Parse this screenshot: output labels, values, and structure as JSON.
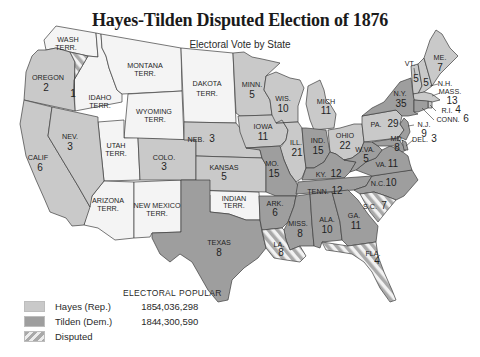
{
  "header": {
    "title": "Hayes-Tilden Disputed Election of 1876",
    "subtitle": "Electoral Vote by State"
  },
  "colors": {
    "hayes": "#c9c9c9",
    "tilden": "#9e9e9e",
    "territory": "#f4f4f4",
    "disputed_stripe": "#a9a9a9",
    "border": "#3a3a3a"
  },
  "legend": {
    "col_electoral": "ELECTORAL",
    "col_popular": "POPULAR",
    "rows": [
      {
        "name": "Hayes (Rep.)",
        "electoral": "185",
        "popular": "4,036,298",
        "swatch": "hayes"
      },
      {
        "name": "Tilden (Dem.)",
        "electoral": "184",
        "popular": "4,300,590",
        "swatch": "tilden"
      },
      {
        "name": "Disputed",
        "electoral": "",
        "popular": "",
        "swatch": "disputed"
      }
    ]
  },
  "map": {
    "regions": [
      {
        "id": "wash",
        "label": "WASH",
        "label2": "TERR.",
        "votes": "",
        "party": "territory"
      },
      {
        "id": "oregon",
        "label": "OREGON",
        "votes": "2",
        "party": "hayes"
      },
      {
        "id": "oregon-disputed",
        "label": "",
        "votes": "1",
        "party": "disputed"
      },
      {
        "id": "idaho",
        "label": "IDAHO",
        "label2": "TERR.",
        "votes": "",
        "party": "territory"
      },
      {
        "id": "montana",
        "label": "MONTANA",
        "label2": "TERR.",
        "votes": "",
        "party": "territory"
      },
      {
        "id": "wyoming",
        "label": "WYOMING",
        "label2": "TERR.",
        "votes": "",
        "party": "territory"
      },
      {
        "id": "dakota",
        "label": "DAKOTA",
        "label2": "TERR.",
        "votes": "",
        "party": "territory"
      },
      {
        "id": "calif",
        "label": "CALIF",
        "votes": "6",
        "party": "hayes"
      },
      {
        "id": "nev",
        "label": "NEV.",
        "votes": "3",
        "party": "hayes"
      },
      {
        "id": "utah",
        "label": "UTAH",
        "label2": "TERR.",
        "votes": "",
        "party": "territory"
      },
      {
        "id": "colo",
        "label": "COLO.",
        "votes": "3",
        "party": "hayes"
      },
      {
        "id": "arizona",
        "label": "ARIZONA",
        "label2": "TERR.",
        "votes": "",
        "party": "territory"
      },
      {
        "id": "newmexico",
        "label": "NEW MEXICO",
        "label2": "TERR.",
        "votes": "",
        "party": "territory"
      },
      {
        "id": "indian",
        "label": "INDIAN",
        "label2": "TERR.",
        "votes": "",
        "party": "territory"
      },
      {
        "id": "texas",
        "label": "TEXAS",
        "votes": "8",
        "party": "tilden"
      },
      {
        "id": "neb",
        "label": "NEB.",
        "votes": "3",
        "party": "hayes"
      },
      {
        "id": "kansas",
        "label": "KANSAS",
        "votes": "5",
        "party": "hayes"
      },
      {
        "id": "minn",
        "label": "MINN.",
        "votes": "5",
        "party": "hayes"
      },
      {
        "id": "iowa",
        "label": "IOWA",
        "votes": "11",
        "party": "hayes"
      },
      {
        "id": "mo",
        "label": "MO.",
        "votes": "15",
        "party": "tilden"
      },
      {
        "id": "ark",
        "label": "ARK.",
        "votes": "6",
        "party": "tilden"
      },
      {
        "id": "la",
        "label": "LA.",
        "votes": "8",
        "party": "disputed"
      },
      {
        "id": "wis",
        "label": "WIS.",
        "votes": "10",
        "party": "hayes"
      },
      {
        "id": "ill",
        "label": "ILL.",
        "votes": "21",
        "party": "hayes"
      },
      {
        "id": "mich",
        "label": "MICH",
        "votes": "11",
        "party": "hayes"
      },
      {
        "id": "ind",
        "label": "IND.",
        "votes": "15",
        "party": "tilden"
      },
      {
        "id": "ohio",
        "label": "OHIO",
        "votes": "22",
        "party": "hayes"
      },
      {
        "id": "ky",
        "label": "KY.",
        "votes": "12",
        "party": "tilden"
      },
      {
        "id": "tenn",
        "label": "TENN.",
        "votes": "12",
        "party": "tilden"
      },
      {
        "id": "miss",
        "label": "MISS.",
        "votes": "8",
        "party": "tilden"
      },
      {
        "id": "ala",
        "label": "ALA.",
        "votes": "10",
        "party": "tilden"
      },
      {
        "id": "ga",
        "label": "GA.",
        "votes": "11",
        "party": "tilden"
      },
      {
        "id": "fla",
        "label": "FLA.",
        "votes": "4",
        "party": "disputed"
      },
      {
        "id": "sc",
        "label": "S.C.",
        "votes": "7",
        "party": "disputed"
      },
      {
        "id": "nc",
        "label": "N.C.",
        "votes": "10",
        "party": "tilden"
      },
      {
        "id": "va",
        "label": "VA.",
        "votes": "11",
        "party": "tilden"
      },
      {
        "id": "wva",
        "label": "W.VA.",
        "votes": "5",
        "party": "tilden"
      },
      {
        "id": "md",
        "label": "MD.",
        "votes": "8",
        "party": "tilden"
      },
      {
        "id": "del",
        "label": "DEL.",
        "votes": "3",
        "party": "tilden"
      },
      {
        "id": "nj",
        "label": "N.J.",
        "votes": "9",
        "party": "tilden"
      },
      {
        "id": "pa",
        "label": "PA.",
        "votes": "29",
        "party": "hayes"
      },
      {
        "id": "ny",
        "label": "N.Y.",
        "votes": "35",
        "party": "tilden"
      },
      {
        "id": "vt",
        "label": "VT.",
        "votes": "5",
        "party": "hayes"
      },
      {
        "id": "nh",
        "label": "N.H.",
        "votes": "5",
        "party": "hayes"
      },
      {
        "id": "me",
        "label": "ME.",
        "votes": "7",
        "party": "hayes"
      },
      {
        "id": "mass",
        "label": "MASS.",
        "votes": "13",
        "party": "hayes"
      },
      {
        "id": "ri",
        "label": "R.I.",
        "votes": "4",
        "party": "hayes"
      },
      {
        "id": "conn",
        "label": "CONN.",
        "votes": "6",
        "party": "tilden"
      }
    ]
  }
}
